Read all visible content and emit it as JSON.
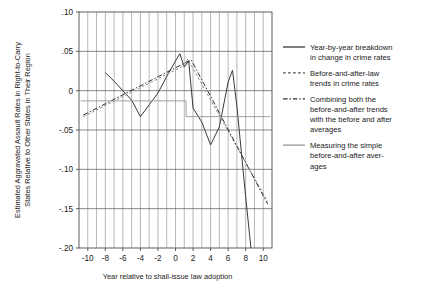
{
  "chart_data": {
    "type": "line",
    "title": "",
    "xlabel": "Year relative to shall-issue law adoption",
    "ylabel": "Estimated Aggravated Assault Rates in Right-to-Carry States Relative to Other States in Their Region",
    "ylabel_line1": "Estimated Aggravated Assault Rates in Right-to-Carry",
    "ylabel_line2": "States Relative to Other States in Their Region",
    "xlim": [
      -11,
      11
    ],
    "ylim": [
      -0.2,
      0.1
    ],
    "grid": "vertical-minor-and-horizontal-major",
    "legend_position": "right",
    "x_ticks": [
      -10,
      -8,
      -6,
      -4,
      -2,
      0,
      2,
      4,
      6,
      8,
      10
    ],
    "x_tick_labels": [
      "-10",
      "-8",
      "-6",
      "-4",
      "-2",
      "0",
      "2",
      "4",
      "6",
      "8",
      "10"
    ],
    "y_ticks": [
      0.1,
      0.05,
      0,
      -0.05,
      -0.1,
      -0.15,
      -0.2
    ],
    "y_tick_labels": [
      ".10",
      ".05",
      "0",
      "-.05",
      "-.10",
      "-.15",
      "-.20"
    ],
    "x_minor_step": 1,
    "series": [
      {
        "name": "Year-by-year breakdown in change in crime rates",
        "style": "solid",
        "color": "#3a3a3a",
        "x": [
          -8,
          -7,
          -6,
          -5,
          -4,
          -3,
          -2,
          -1,
          0,
          0.5,
          1,
          1.5,
          2,
          3,
          4,
          5,
          6,
          6.5,
          7,
          8,
          8.6,
          9
        ],
        "y": [
          0.023,
          0.012,
          0.0,
          -0.012,
          -0.033,
          -0.018,
          -0.003,
          0.018,
          0.038,
          0.047,
          0.03,
          0.038,
          -0.022,
          -0.04,
          -0.069,
          -0.046,
          0.011,
          0.026,
          -0.02,
          -0.135,
          -0.2,
          -0.26
        ]
      },
      {
        "name": "Before-and-after-law trends in crime rates",
        "style": "dashed",
        "color": "#8a8a8a",
        "x": [
          -10.5,
          0.8,
          1.4,
          10.5
        ],
        "y": [
          -0.033,
          0.031,
          0.04,
          -0.141
        ]
      },
      {
        "name": "Combining both the before-and-after trends with the before and after averages",
        "style": "dashdot",
        "color": "#2f2f2f",
        "x": [
          -10.5,
          1.2,
          1.8,
          10.5
        ],
        "y": [
          -0.031,
          0.036,
          0.039,
          -0.144
        ]
      },
      {
        "name": "Measuring the simple before-and-after averages",
        "style": "step",
        "color": "#909090",
        "x": [
          -10.8,
          0.4,
          0.4,
          1.2,
          1.2,
          10.8
        ],
        "y": [
          -0.013,
          -0.013,
          -0.013,
          -0.013,
          -0.033,
          -0.033
        ]
      }
    ],
    "legend": [
      {
        "swatch": "solid",
        "lines": [
          "Year-by-year breakdown",
          "in change in crime rates"
        ]
      },
      {
        "swatch": "dashed",
        "lines": [
          "Before-and-after-law",
          "trends in crime rates"
        ]
      },
      {
        "swatch": "dashdot",
        "lines": [
          "Combining both the",
          "before-and-after trends",
          "with the before and after",
          "averages"
        ]
      },
      {
        "swatch": "step",
        "lines": [
          "Measuring the simple",
          "before-and-after aver-",
          "ages"
        ]
      }
    ]
  }
}
